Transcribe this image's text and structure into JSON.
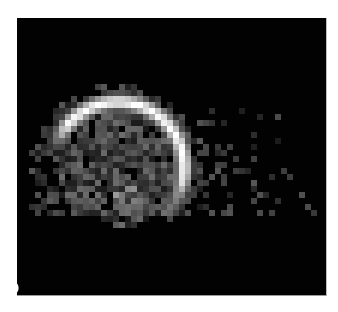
{
  "figure": {
    "panel_label": "(b)",
    "background_color": "#020202",
    "page_color": "#ffffff",
    "image": {
      "description": "Pixelated grayscale intensity map with bright crescent arc and scattered speckle",
      "block_size_px": 6,
      "arc": {
        "center": [
          118,
          168
        ],
        "radius": 66,
        "start_angle_deg": 195,
        "end_angle_deg": 405,
        "thickness": 11,
        "peak_gray": 235
      },
      "disk": {
        "center": [
          118,
          168
        ],
        "radius": 60,
        "mean_gray": 80,
        "fill_fraction": 0.8
      },
      "speckle_region": {
        "x_range": [
          30,
          320
        ],
        "y_range": [
          62,
          215
        ],
        "mean_gray": 70
      }
    }
  }
}
